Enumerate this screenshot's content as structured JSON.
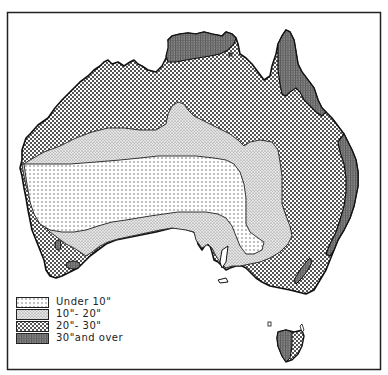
{
  "map": {
    "subject": "Australia annual rainfall",
    "frame": {
      "left": 7,
      "top": 12,
      "right": 381,
      "bottom": 370
    }
  },
  "legend": {
    "items": [
      {
        "label": "Under 10\"",
        "pattern": "fine-dots",
        "color": "#f2f2f2"
      },
      {
        "label": "10\"- 20\"",
        "pattern": "stipple",
        "color": "#d9d9d9"
      },
      {
        "label": "20\"- 30\"",
        "pattern": "crosshatch",
        "color": "#a8a8a8"
      },
      {
        "label": "30\"and over",
        "pattern": "dense-grid",
        "color": "#7a7a7a"
      }
    ]
  },
  "zones": [
    {
      "name": "Under 10 inches",
      "region": "central-west interior"
    },
    {
      "name": "10-20 inches",
      "region": "band surrounding interior"
    },
    {
      "name": "20-30 inches",
      "region": "north, east and southwest coastal belt"
    },
    {
      "name": "30 inches and over",
      "region": "Top End, Cape York, east coast, SW tip, Tasmania west"
    }
  ]
}
